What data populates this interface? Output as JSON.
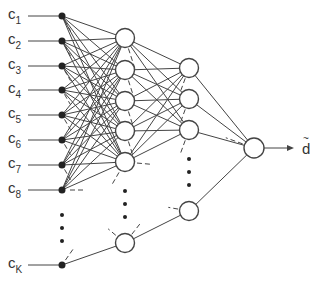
{
  "diagram": {
    "type": "feedforward-neural-network",
    "colors": {
      "stroke": "#444444",
      "node_fill": "#ffffff",
      "dot_fill": "#222222",
      "text": "#333333"
    },
    "inputs": {
      "x": 62,
      "label_x": 8,
      "nodes": [
        {
          "label": "c",
          "sub": "1",
          "y": 16
        },
        {
          "label": "c",
          "sub": "2",
          "y": 41
        },
        {
          "label": "c",
          "sub": "3",
          "y": 66
        },
        {
          "label": "c",
          "sub": "4",
          "y": 90
        },
        {
          "label": "c",
          "sub": "5",
          "y": 115
        },
        {
          "label": "c",
          "sub": "6",
          "y": 140
        },
        {
          "label": "c",
          "sub": "7",
          "y": 165
        },
        {
          "label": "c",
          "sub": "8",
          "y": 190
        },
        {
          "label": "c",
          "sub": "K",
          "y": 265
        }
      ],
      "ellipsis_y": [
        215,
        228,
        241
      ]
    },
    "hidden1": {
      "x": 125,
      "r": 9.5,
      "nodes_y": [
        38,
        70,
        101,
        131,
        162,
        243
      ],
      "ellipsis_y": [
        191,
        204,
        217
      ]
    },
    "hidden2": {
      "x": 189,
      "r": 9.5,
      "nodes_y": [
        68,
        99,
        130,
        211
      ],
      "ellipsis_y": [
        159,
        172,
        185
      ]
    },
    "output": {
      "x": 254,
      "y": 148,
      "r": 10,
      "arrow_end_x": 294,
      "label": "d",
      "label_accent": "~"
    }
  }
}
